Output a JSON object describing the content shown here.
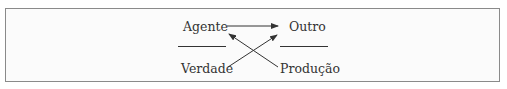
{
  "diagram": {
    "nodes": {
      "agente": "Agente",
      "outro": "Outro",
      "verdade": "Verdade",
      "producao": "Produção"
    },
    "edges": [
      {
        "from": "Agente",
        "to": "Outro"
      },
      {
        "from": "Verdade",
        "to": "Outro"
      },
      {
        "from": "Produção",
        "to": "Agente"
      }
    ],
    "colors": {
      "border": "#8a8a8a",
      "text": "#333333",
      "background": "#fbfbfb"
    }
  }
}
